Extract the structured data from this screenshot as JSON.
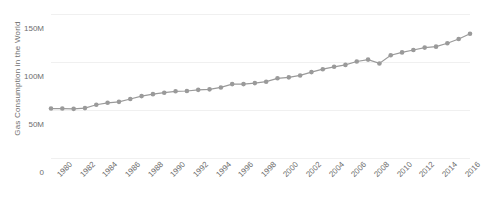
{
  "chart_data": {
    "type": "line",
    "title": "",
    "xlabel": "",
    "ylabel": "Gas Consumption in the World",
    "ylim": [
      0,
      150000000
    ],
    "xlim": [
      1980,
      2017
    ],
    "grid": true,
    "legend": null,
    "marker": "circle",
    "series_color": "#9a9a9a",
    "grid_color": "#f0f0f0",
    "text_color": "#6e6e6e",
    "y_ticks": [
      {
        "value": 0,
        "label": "0"
      },
      {
        "value": 50000000,
        "label": "50M"
      },
      {
        "value": 100000000,
        "label": "100M"
      },
      {
        "value": 150000000,
        "label": "150M"
      }
    ],
    "x_tick_labels": [
      "1980",
      "1982",
      "1984",
      "1986",
      "1988",
      "1990",
      "1992",
      "1994",
      "1996",
      "1998",
      "2000",
      "2002",
      "2004",
      "2006",
      "2008",
      "2010",
      "2012",
      "2014",
      "2016"
    ],
    "x": [
      1980,
      1981,
      1982,
      1983,
      1984,
      1985,
      1986,
      1987,
      1988,
      1989,
      1990,
      1991,
      1992,
      1993,
      1994,
      1995,
      1996,
      1997,
      1998,
      1999,
      2000,
      2001,
      2002,
      2003,
      2004,
      2005,
      2006,
      2007,
      2008,
      2009,
      2010,
      2011,
      2012,
      2013,
      2014,
      2015,
      2016,
      2017
    ],
    "values": [
      51500000,
      51500000,
      51200000,
      52000000,
      55500000,
      57500000,
      58500000,
      61500000,
      64500000,
      66500000,
      68000000,
      69500000,
      69800000,
      71000000,
      71500000,
      73500000,
      77000000,
      77000000,
      78000000,
      79500000,
      83000000,
      84000000,
      86000000,
      89500000,
      92500000,
      95000000,
      97000000,
      100500000,
      102500000,
      98500000,
      107000000,
      110000000,
      112500000,
      115000000,
      116000000,
      119500000,
      124000000,
      129500000
    ],
    "series_name": "Gas Consumption in the World"
  }
}
